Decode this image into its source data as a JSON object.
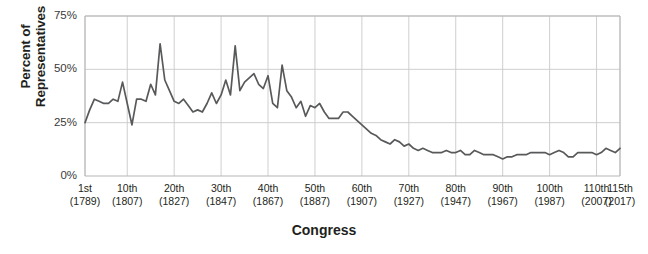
{
  "chart_data": {
    "type": "line",
    "title": "",
    "xlabel": "Congress",
    "ylabel": "Percent of\nRepresentatives",
    "ylim": [
      0,
      75
    ],
    "xlim": [
      1,
      115
    ],
    "grid": true,
    "legend": null,
    "line_color": "#58595b",
    "y_ticks": [
      "0%",
      "25%",
      "50%",
      "75%"
    ],
    "y_tick_values": [
      0,
      25,
      50,
      75
    ],
    "x_ticks": [
      {
        "label": "1st",
        "year": "(1789)",
        "congress": 1
      },
      {
        "label": "10th",
        "year": "(1807)",
        "congress": 10
      },
      {
        "label": "20th",
        "year": "(1827)",
        "congress": 20
      },
      {
        "label": "30th",
        "year": "(1847)",
        "congress": 30
      },
      {
        "label": "40th",
        "year": "(1867)",
        "congress": 40
      },
      {
        "label": "50th",
        "year": "(1887)",
        "congress": 50
      },
      {
        "label": "60th",
        "year": "(1907)",
        "congress": 60
      },
      {
        "label": "70th",
        "year": "(1927)",
        "congress": 70
      },
      {
        "label": "80th",
        "year": "(1947)",
        "congress": 80
      },
      {
        "label": "90th",
        "year": "(1967)",
        "congress": 90
      },
      {
        "label": "100th",
        "year": "(1987)",
        "congress": 100
      },
      {
        "label": "110th",
        "year": "(2007)",
        "congress": 110
      },
      {
        "label": "115th",
        "year": "(2017)",
        "congress": 115
      }
    ],
    "x": [
      1,
      2,
      3,
      4,
      5,
      6,
      7,
      8,
      9,
      10,
      11,
      12,
      13,
      14,
      15,
      16,
      17,
      18,
      19,
      20,
      21,
      22,
      23,
      24,
      25,
      26,
      27,
      28,
      29,
      30,
      31,
      32,
      33,
      34,
      35,
      36,
      37,
      38,
      39,
      40,
      41,
      42,
      43,
      44,
      45,
      46,
      47,
      48,
      49,
      50,
      51,
      52,
      53,
      54,
      55,
      56,
      57,
      58,
      59,
      60,
      61,
      62,
      63,
      64,
      65,
      66,
      67,
      68,
      69,
      70,
      71,
      72,
      73,
      74,
      75,
      76,
      77,
      78,
      79,
      80,
      81,
      82,
      83,
      84,
      85,
      86,
      87,
      88,
      89,
      90,
      91,
      92,
      93,
      94,
      95,
      96,
      97,
      98,
      99,
      100,
      101,
      102,
      103,
      104,
      105,
      106,
      107,
      108,
      109,
      110,
      111,
      112,
      113,
      114,
      115
    ],
    "values": [
      25,
      31,
      36,
      35,
      34,
      34,
      36,
      35,
      44,
      34,
      24,
      36,
      36,
      35,
      43,
      38,
      62,
      45,
      40,
      35,
      34,
      36,
      33,
      30,
      31,
      30,
      34,
      39,
      34,
      38,
      45,
      38,
      61,
      40,
      44,
      46,
      48,
      43,
      41,
      47,
      34,
      32,
      52,
      40,
      37,
      32,
      35,
      28,
      33,
      32,
      34,
      30,
      27,
      27,
      27,
      30,
      30,
      28,
      26,
      24,
      22,
      20,
      19,
      17,
      16,
      15,
      17,
      16,
      14,
      15,
      13,
      12,
      13,
      12,
      11,
      11,
      11,
      12,
      11,
      11,
      12,
      10,
      10,
      12,
      11,
      10,
      10,
      10,
      9,
      8,
      9,
      9,
      10,
      10,
      10,
      11,
      11,
      11,
      11,
      10,
      11,
      12,
      11,
      9,
      9,
      11,
      11,
      11,
      11,
      10,
      11,
      13,
      12,
      11,
      13
    ],
    "series_name": "Percent of Representatives"
  },
  "axis": {
    "y_title": "Percent of Representatives",
    "x_title": "Congress"
  }
}
